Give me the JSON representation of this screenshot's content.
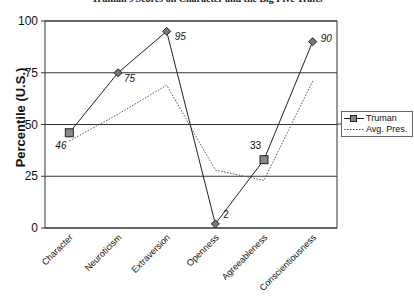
{
  "title": "Truman's Scores on Character and the Big Five Traits",
  "chart_data": {
    "type": "line",
    "title": "Truman's Scores on Character and the Big Five Traits",
    "xlabel": "",
    "ylabel": "Percentile (U.S.)",
    "ylim": [
      0,
      100
    ],
    "yticks": [
      0,
      25,
      50,
      75,
      100
    ],
    "grid": true,
    "legend_position": "right",
    "categories": [
      "Character",
      "Neuroticism",
      "Extraversion",
      "Openness",
      "Agreeableness",
      "Conscientiousness"
    ],
    "series": [
      {
        "name": "Truman",
        "style": "solid-with-markers",
        "values": [
          46,
          75,
          95,
          2,
          33,
          90
        ],
        "data_labels": [
          "46",
          "75",
          "95",
          "2",
          "33",
          "90"
        ]
      },
      {
        "name": "Avg. Pres.",
        "style": "dotted",
        "values": [
          42,
          55,
          69,
          28,
          23,
          71
        ]
      }
    ]
  },
  "legend": {
    "items": [
      {
        "label": "Truman"
      },
      {
        "label": "Avg. Pres."
      }
    ]
  },
  "axis": {
    "ylabel": "Percentile (U.S.)"
  }
}
